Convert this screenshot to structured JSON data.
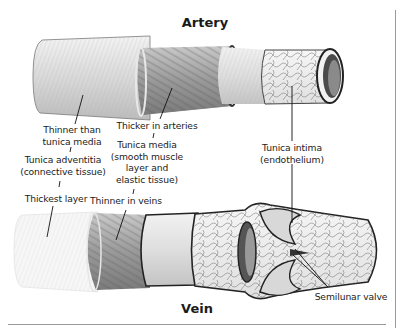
{
  "titles": {
    "artery": "Artery",
    "vein": "Vein"
  },
  "labels": {
    "adventitia_note": [
      "Thinner than",
      "tunica media"
    ],
    "adventitia_name": [
      "Tunica adventitia",
      "(connective tissue)"
    ],
    "adventitia_vein_note": "Thickest layer",
    "media_artery_note": "Thicker in arteries",
    "media_name": [
      "Tunica media",
      "(smooth muscle",
      "layer and",
      "elastic tissue)"
    ],
    "media_vein_note": "Thinner in veins",
    "intima_name": [
      "Tunica intima",
      "(endothelium)"
    ],
    "valve_name": "Semilunar valve"
  },
  "icons": {
    "artery": "artery-cross-section-illustration",
    "vein": "vein-cross-section-illustration"
  },
  "colors": {
    "ink": "#1a1a1a",
    "tissue_light": "#eeeeee",
    "tissue_mid": "#bdbdbd",
    "tissue_dark": "#555555",
    "frame": "#9a9a9a"
  }
}
